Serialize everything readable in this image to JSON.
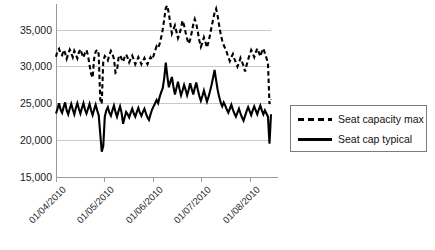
{
  "chart_data": {
    "type": "line",
    "title": "",
    "xlabel": "",
    "ylabel": "",
    "ylim": [
      15000,
      36800
    ],
    "xlim": [
      "01/04/2010",
      "12/08/2010"
    ],
    "grid": true,
    "legend_position": "right",
    "y_ticks": [
      "15,000",
      "20,000",
      "25,000",
      "30,000",
      "35,000"
    ],
    "y_tick_values": [
      15000,
      20000,
      25000,
      30000,
      35000
    ],
    "x_ticks": [
      "01/04/2010",
      "01/05/2010",
      "01/06/2010",
      "01/07/2010",
      "01/08/2010"
    ],
    "x_tick_index": [
      0,
      30,
      61,
      91,
      122
    ],
    "series": [
      {
        "name": "Seat capacity max",
        "style": "dashed",
        "color": "#000000",
        "values": [
          30150,
          30900,
          31150,
          30500,
          30350,
          31000,
          30600,
          29900,
          30500,
          31050,
          30600,
          30100,
          30900,
          30450,
          29950,
          30700,
          31100,
          30500,
          30050,
          30650,
          31000,
          30300,
          29100,
          28000,
          27500,
          29900,
          30800,
          31050,
          30500,
          24800,
          24200,
          29600,
          30250,
          30050,
          29700,
          30400,
          30900,
          30500,
          29900,
          28150,
          28400,
          30000,
          30350,
          29900,
          29500,
          30100,
          30450,
          30000,
          29450,
          29900,
          30300,
          29800,
          29200,
          29600,
          30100,
          29700,
          29200,
          29600,
          30000,
          29550,
          29200,
          29700,
          30100,
          29800,
          30300,
          30900,
          31500,
          31300,
          31800,
          32600,
          33600,
          34900,
          36300,
          36600,
          35600,
          34300,
          33100,
          33600,
          34100,
          33300,
          32500,
          33000,
          33800,
          34700,
          34100,
          33200,
          32400,
          31800,
          32300,
          33200,
          34200,
          34900,
          34300,
          33300,
          32200,
          31400,
          31900,
          32600,
          32000,
          31300,
          32000,
          32900,
          33900,
          34800,
          35700,
          36200,
          35300,
          34100,
          33000,
          32200,
          31600,
          31200,
          30700,
          30100,
          29600,
          30100,
          30500,
          29900,
          29400,
          28900,
          29400,
          30000,
          29500,
          29000,
          28300,
          29100,
          29800,
          30400,
          31000,
          30600,
          30100,
          30700,
          31200,
          30700,
          30200,
          30800,
          31200,
          30600,
          30000,
          29400,
          24200,
          24800
        ]
      },
      {
        "name": "Seat cap typical",
        "style": "solid",
        "color": "#000000",
        "values": [
          23000,
          23600,
          24300,
          23500,
          23100,
          23800,
          24400,
          23400,
          22900,
          23600,
          24200,
          23500,
          22900,
          23700,
          24300,
          23600,
          23000,
          23700,
          24300,
          23500,
          23000,
          23600,
          24200,
          23400,
          22800,
          23500,
          24100,
          23400,
          22800,
          20500,
          18200,
          18900,
          22600,
          23400,
          23800,
          23100,
          22700,
          23400,
          24000,
          23200,
          22600,
          23300,
          23900,
          23100,
          21700,
          22500,
          23200,
          22900,
          22500,
          23100,
          23600,
          23000,
          22600,
          23200,
          23700,
          23100,
          22700,
          23200,
          23600,
          23000,
          22500,
          22200,
          22900,
          23500,
          23900,
          24300,
          24700,
          24300,
          25100,
          25700,
          26200,
          27500,
          29400,
          27700,
          26300,
          27000,
          27600,
          26400,
          25400,
          26200,
          27000,
          26100,
          25300,
          25900,
          26600,
          26000,
          25300,
          26000,
          26800,
          26100,
          25400,
          26200,
          26900,
          26000,
          25200,
          24600,
          25200,
          25900,
          25200,
          24500,
          25100,
          25800,
          26600,
          27500,
          28500,
          27200,
          26000,
          25100,
          24400,
          23900,
          24400,
          24000,
          23500,
          23100,
          23600,
          24100,
          23500,
          23000,
          22600,
          23100,
          23600,
          23000,
          22500,
          22100,
          22700,
          23300,
          23800,
          23300,
          22800,
          23400,
          23900,
          23400,
          22900,
          23500,
          24000,
          23400,
          22900,
          23400,
          23000,
          22600,
          19200,
          22900
        ]
      }
    ]
  },
  "legend": {
    "items": [
      {
        "label": "Seat capacity max",
        "key": "dashed-line-key"
      },
      {
        "label": "Seat cap typical",
        "key": "solid-line-key"
      }
    ]
  }
}
